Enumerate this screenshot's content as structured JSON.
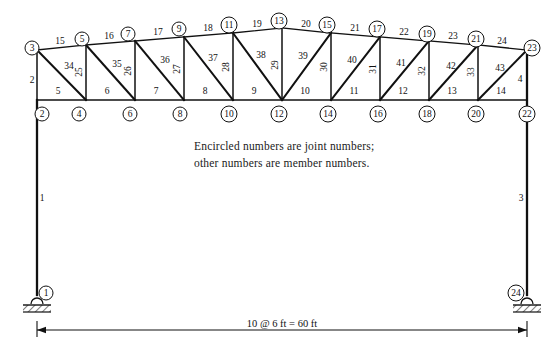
{
  "figure": {
    "note_line_1": "Encircled numbers are joint numbers;",
    "note_line_2": "other numbers are member numbers.",
    "dimension_label": "10 @ 6 ft = 60 ft",
    "line_color": "#111111",
    "background_color": "#ffffff"
  },
  "joints": [
    {
      "id": "1",
      "label": "1",
      "x": 37,
      "y": 295,
      "lx": 46,
      "ly": 293
    },
    {
      "id": "2",
      "label": "2",
      "x": 37,
      "y": 100,
      "lx": 42,
      "ly": 114
    },
    {
      "id": "3",
      "label": "3",
      "x": 37,
      "y": 50,
      "lx": 32,
      "ly": 48
    },
    {
      "id": "4",
      "label": "4",
      "x": 86,
      "y": 100,
      "lx": 79,
      "ly": 114
    },
    {
      "id": "5",
      "label": "5",
      "x": 86,
      "y": 45,
      "lx": 82,
      "ly": 39
    },
    {
      "id": "6",
      "label": "6",
      "x": 135,
      "y": 100,
      "lx": 130,
      "ly": 114
    },
    {
      "id": "7",
      "label": "7",
      "x": 135,
      "y": 41,
      "lx": 128,
      "ly": 34
    },
    {
      "id": "8",
      "label": "8",
      "x": 184,
      "y": 100,
      "lx": 180,
      "ly": 114
    },
    {
      "id": "9",
      "label": "9",
      "x": 184,
      "y": 37,
      "lx": 179,
      "ly": 29
    },
    {
      "id": "10",
      "label": "10",
      "x": 233,
      "y": 100,
      "lx": 229,
      "ly": 114
    },
    {
      "id": "11",
      "label": "11",
      "x": 233,
      "y": 33,
      "lx": 229,
      "ly": 25
    },
    {
      "id": "12",
      "label": "12",
      "x": 282,
      "y": 100,
      "lx": 279,
      "ly": 114
    },
    {
      "id": "13",
      "label": "13",
      "x": 282,
      "y": 28,
      "lx": 279,
      "ly": 21
    },
    {
      "id": "14",
      "label": "14",
      "x": 331,
      "y": 100,
      "lx": 328,
      "ly": 114
    },
    {
      "id": "15",
      "label": "15",
      "x": 331,
      "y": 33,
      "lx": 327,
      "ly": 25
    },
    {
      "id": "16",
      "label": "16",
      "x": 380,
      "y": 100,
      "lx": 378,
      "ly": 114
    },
    {
      "id": "17",
      "label": "17",
      "x": 380,
      "y": 37,
      "lx": 377,
      "ly": 29
    },
    {
      "id": "18",
      "label": "18",
      "x": 429,
      "y": 100,
      "lx": 427,
      "ly": 114
    },
    {
      "id": "19",
      "label": "19",
      "x": 429,
      "y": 41,
      "lx": 427,
      "ly": 34
    },
    {
      "id": "20",
      "label": "20",
      "x": 478,
      "y": 100,
      "lx": 476,
      "ly": 114
    },
    {
      "id": "21",
      "label": "21",
      "x": 478,
      "y": 45,
      "lx": 476,
      "ly": 39
    },
    {
      "id": "22",
      "label": "22",
      "x": 527,
      "y": 100,
      "lx": 527,
      "ly": 114
    },
    {
      "id": "23",
      "label": "23",
      "x": 527,
      "y": 50,
      "lx": 532,
      "ly": 48
    },
    {
      "id": "24",
      "label": "24",
      "x": 527,
      "y": 295,
      "lx": 516,
      "ly": 293
    }
  ],
  "members": [
    {
      "id": "1",
      "label": "1",
      "x1": 37,
      "y1": 295,
      "x2": 37,
      "y2": 100,
      "kind": "column",
      "lx": 42,
      "ly": 199
    },
    {
      "id": "2",
      "label": "2",
      "x1": 37,
      "y1": 100,
      "x2": 37,
      "y2": 50,
      "kind": "web",
      "lx": 32,
      "ly": 81
    },
    {
      "id": "3",
      "label": "3",
      "x1": 527,
      "y1": 295,
      "x2": 527,
      "y2": 50,
      "kind": "column",
      "lx": 521,
      "ly": 199
    },
    {
      "id": "4",
      "label": "4",
      "x1": 527,
      "y1": 100,
      "x2": 527,
      "y2": 50,
      "kind": "web",
      "lx": 520,
      "ly": 80
    },
    {
      "id": "5",
      "label": "5",
      "x1": 37,
      "y1": 100,
      "x2": 86,
      "y2": 100,
      "kind": "chord",
      "lx": 58,
      "ly": 92
    },
    {
      "id": "6",
      "label": "6",
      "x1": 86,
      "y1": 100,
      "x2": 135,
      "y2": 100,
      "kind": "chord",
      "lx": 107,
      "ly": 92
    },
    {
      "id": "7",
      "label": "7",
      "x1": 135,
      "y1": 100,
      "x2": 184,
      "y2": 100,
      "kind": "chord",
      "lx": 156,
      "ly": 92
    },
    {
      "id": "8",
      "label": "8",
      "x1": 184,
      "y1": 100,
      "x2": 233,
      "y2": 100,
      "kind": "chord",
      "lx": 205,
      "ly": 92
    },
    {
      "id": "9",
      "label": "9",
      "x1": 233,
      "y1": 100,
      "x2": 282,
      "y2": 100,
      "kind": "chord",
      "lx": 254,
      "ly": 92
    },
    {
      "id": "10",
      "label": "10",
      "x1": 282,
      "y1": 100,
      "x2": 331,
      "y2": 100,
      "kind": "chord",
      "lx": 305,
      "ly": 92
    },
    {
      "id": "11",
      "label": "11",
      "x1": 331,
      "y1": 100,
      "x2": 380,
      "y2": 100,
      "kind": "chord",
      "lx": 354,
      "ly": 92
    },
    {
      "id": "12",
      "label": "12",
      "x1": 380,
      "y1": 100,
      "x2": 429,
      "y2": 100,
      "kind": "chord",
      "lx": 403,
      "ly": 92
    },
    {
      "id": "13",
      "label": "13",
      "x1": 429,
      "y1": 100,
      "x2": 478,
      "y2": 100,
      "kind": "chord",
      "lx": 452,
      "ly": 92
    },
    {
      "id": "14",
      "label": "14",
      "x1": 478,
      "y1": 100,
      "x2": 527,
      "y2": 100,
      "kind": "chord",
      "lx": 501,
      "ly": 92
    },
    {
      "id": "15",
      "label": "15",
      "x1": 37,
      "y1": 50,
      "x2": 86,
      "y2": 45,
      "kind": "chord",
      "lx": 60,
      "ly": 42
    },
    {
      "id": "16",
      "label": "16",
      "x1": 86,
      "y1": 45,
      "x2": 135,
      "y2": 41,
      "kind": "chord",
      "lx": 109,
      "ly": 37
    },
    {
      "id": "17",
      "label": "17",
      "x1": 135,
      "y1": 41,
      "x2": 184,
      "y2": 37,
      "kind": "chord",
      "lx": 158,
      "ly": 33
    },
    {
      "id": "18",
      "label": "18",
      "x1": 184,
      "y1": 37,
      "x2": 233,
      "y2": 33,
      "kind": "chord",
      "lx": 208,
      "ly": 29
    },
    {
      "id": "19",
      "label": "19",
      "x1": 233,
      "y1": 33,
      "x2": 282,
      "y2": 28,
      "kind": "chord",
      "lx": 257,
      "ly": 25
    },
    {
      "id": "20",
      "label": "20",
      "x1": 282,
      "y1": 28,
      "x2": 331,
      "y2": 33,
      "kind": "chord",
      "lx": 306,
      "ly": 25
    },
    {
      "id": "21",
      "label": "21",
      "x1": 331,
      "y1": 33,
      "x2": 380,
      "y2": 37,
      "kind": "chord",
      "lx": 355,
      "ly": 29
    },
    {
      "id": "22",
      "label": "22",
      "x1": 380,
      "y1": 37,
      "x2": 429,
      "y2": 41,
      "kind": "chord",
      "lx": 404,
      "ly": 33
    },
    {
      "id": "23",
      "label": "23",
      "x1": 429,
      "y1": 41,
      "x2": 478,
      "y2": 45,
      "kind": "chord",
      "lx": 453,
      "ly": 37
    },
    {
      "id": "24",
      "label": "24",
      "x1": 478,
      "y1": 45,
      "x2": 527,
      "y2": 50,
      "kind": "chord",
      "lx": 502,
      "ly": 42
    },
    {
      "id": "25",
      "label": "25",
      "x1": 86,
      "y1": 100,
      "x2": 86,
      "y2": 45,
      "kind": "web",
      "lx": 80,
      "ly": 72,
      "rot": -90
    },
    {
      "id": "26",
      "label": "26",
      "x1": 135,
      "y1": 100,
      "x2": 135,
      "y2": 41,
      "kind": "web",
      "lx": 129,
      "ly": 71,
      "rot": -90
    },
    {
      "id": "27",
      "label": "27",
      "x1": 184,
      "y1": 100,
      "x2": 184,
      "y2": 37,
      "kind": "web",
      "lx": 178,
      "ly": 69,
      "rot": -90
    },
    {
      "id": "28",
      "label": "28",
      "x1": 233,
      "y1": 100,
      "x2": 233,
      "y2": 33,
      "kind": "web",
      "lx": 227,
      "ly": 67,
      "rot": -90
    },
    {
      "id": "29",
      "label": "29",
      "x1": 282,
      "y1": 100,
      "x2": 282,
      "y2": 28,
      "kind": "web",
      "lx": 276,
      "ly": 65,
      "rot": -90
    },
    {
      "id": "30",
      "label": "30",
      "x1": 331,
      "y1": 100,
      "x2": 331,
      "y2": 33,
      "kind": "web",
      "lx": 325,
      "ly": 67,
      "rot": -90
    },
    {
      "id": "31",
      "label": "31",
      "x1": 380,
      "y1": 100,
      "x2": 380,
      "y2": 37,
      "kind": "web",
      "lx": 374,
      "ly": 69,
      "rot": -90
    },
    {
      "id": "32",
      "label": "32",
      "x1": 429,
      "y1": 100,
      "x2": 429,
      "y2": 41,
      "kind": "web",
      "lx": 423,
      "ly": 71,
      "rot": -90
    },
    {
      "id": "33",
      "label": "33",
      "x1": 478,
      "y1": 100,
      "x2": 478,
      "y2": 45,
      "kind": "web",
      "lx": 472,
      "ly": 72,
      "rot": -90
    },
    {
      "id": "34",
      "label": "34",
      "x1": 37,
      "y1": 50,
      "x2": 86,
      "y2": 100,
      "kind": "diag",
      "lx": 69,
      "ly": 67
    },
    {
      "id": "35",
      "label": "35",
      "x1": 86,
      "y1": 45,
      "x2": 135,
      "y2": 100,
      "kind": "diag",
      "lx": 117,
      "ly": 65
    },
    {
      "id": "36",
      "label": "36",
      "x1": 135,
      "y1": 41,
      "x2": 184,
      "y2": 100,
      "kind": "diag",
      "lx": 165,
      "ly": 61
    },
    {
      "id": "37",
      "label": "37",
      "x1": 184,
      "y1": 37,
      "x2": 233,
      "y2": 100,
      "kind": "diag",
      "lx": 213,
      "ly": 59
    },
    {
      "id": "38",
      "label": "38",
      "x1": 233,
      "y1": 33,
      "x2": 282,
      "y2": 100,
      "kind": "diag",
      "lx": 261,
      "ly": 56
    },
    {
      "id": "39",
      "label": "39",
      "x1": 282,
      "y1": 100,
      "x2": 331,
      "y2": 33,
      "kind": "diag",
      "lx": 303,
      "ly": 57
    },
    {
      "id": "40",
      "label": "40",
      "x1": 331,
      "y1": 100,
      "x2": 380,
      "y2": 37,
      "kind": "diag",
      "lx": 352,
      "ly": 61
    },
    {
      "id": "41",
      "label": "41",
      "x1": 380,
      "y1": 100,
      "x2": 429,
      "y2": 41,
      "kind": "diag",
      "lx": 401,
      "ly": 64
    },
    {
      "id": "42",
      "label": "42",
      "x1": 429,
      "y1": 100,
      "x2": 478,
      "y2": 45,
      "kind": "diag",
      "lx": 451,
      "ly": 67
    },
    {
      "id": "43",
      "label": "43",
      "x1": 478,
      "y1": 100,
      "x2": 527,
      "y2": 50,
      "kind": "diag",
      "lx": 500,
      "ly": 69
    }
  ],
  "supports": [
    {
      "id": "left-support",
      "x": 37,
      "y": 304,
      "type": "pin-on-hatched-base"
    },
    {
      "id": "right-support",
      "x": 527,
      "y": 304,
      "type": "pin-on-hatched-base"
    }
  ],
  "dimension_line": {
    "x1": 37,
    "x2": 527,
    "y": 330,
    "label": "10 @ 6 ft = 60 ft",
    "label_x": 282,
    "label_y": 327
  }
}
